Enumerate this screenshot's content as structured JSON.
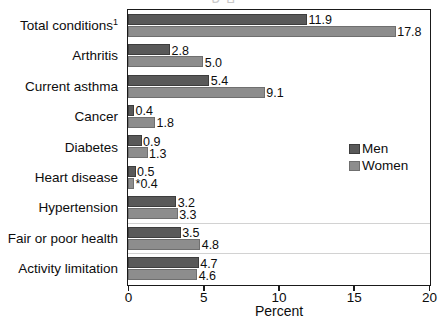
{
  "chart_data": {
    "type": "bar",
    "orientation": "horizontal",
    "title": "",
    "xlabel": "Percent",
    "ylabel": "",
    "xlim": [
      0,
      20
    ],
    "xticks": [
      0,
      5,
      10,
      15,
      20
    ],
    "xtick_labels": [
      "0",
      "5",
      "10",
      "15",
      "20"
    ],
    "grid": false,
    "legend_position": "right-middle",
    "categories": [
      "Total conditions",
      "Arthritis",
      "Current asthma",
      "Cancer",
      "Diabetes",
      "Heart disease",
      "Hypertension",
      "Fair or poor health",
      "Activity limitation"
    ],
    "category_labels": [
      "Total conditions¹",
      "Arthritis",
      "Current asthma",
      "Cancer",
      "Diabetes",
      "Heart disease",
      "Hypertension",
      "Fair or poor health",
      "Activity limitation"
    ],
    "series": [
      {
        "name": "Men",
        "color": "#595959",
        "values": [
          11.9,
          2.8,
          5.4,
          0.4,
          0.9,
          0.5,
          3.2,
          3.5,
          4.7
        ],
        "labels": [
          "11.9",
          "2.8",
          "5.4",
          "0.4",
          "0.9",
          "0.5",
          "3.2",
          "3.5",
          "4.7"
        ]
      },
      {
        "name": "Women",
        "color": "#8d8d8d",
        "values": [
          17.8,
          5.0,
          9.1,
          1.8,
          1.3,
          0.4,
          3.3,
          4.8,
          4.6
        ],
        "labels": [
          "17.8",
          "5.0",
          "9.1",
          "1.8",
          "1.3",
          "*0.4",
          "3.3",
          "4.8",
          "4.6"
        ]
      }
    ]
  },
  "legend": {
    "entries": [
      {
        "label": "Men",
        "color": "#595959"
      },
      {
        "label": "Women",
        "color": "#8d8d8d"
      }
    ]
  },
  "axis": {
    "x_title": "Percent",
    "tick_labels": [
      "0",
      "5",
      "10",
      "15",
      "20"
    ]
  },
  "colors": {
    "men": "#595959",
    "women": "#8d8d8d",
    "axis": "#1a1a1a",
    "separator": "#d2d2d2",
    "background": "#ffffff",
    "text": "#0d0d0d"
  },
  "title_remnant": "ם   ש"
}
